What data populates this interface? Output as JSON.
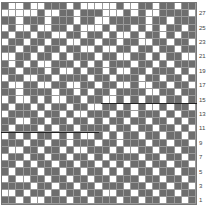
{
  "chart": {
    "type": "knitting-grid",
    "columns": 27,
    "rows": 28,
    "dark_color": "#6e6e6e",
    "light_color": "#ffffff",
    "row_labels": [
      "27",
      "25",
      "23",
      "21",
      "19",
      "17",
      "15",
      "13",
      "11",
      "9",
      "7",
      "5",
      "3",
      "1"
    ],
    "pattern_top_to_bottom": [
      "100100111010000010011011011",
      "000001001101110001010011110",
      "110111011101100111110110111",
      "010010011010001011010101101",
      "101101100110110100101101011",
      "011011011001101101100110110",
      "110110110110010011011011011",
      "001101101011101100110101100",
      "101010011101010111011010111",
      "110111010010110100110111010",
      "011001101111011011101101101",
      "100110011001101100100110110",
      "110111101101011011110011011",
      "010010100110110010101101101",
      "101101011011001101010010110",
      "011110110100111011011101011",
      "110011011011010110110110101",
      "101110101101111011011011010",
      "010101101010010101101101101",
      "111011011011101101110110110",
      "100110110100111010011011011",
      "011011011011010111101101101",
      "110101101101101010110110110",
      "101110110110110101011011011",
      "010011011011011011101101101",
      "111101101101101110110110110",
      "001011010110110011011011011",
      "110100111011011101101101101"
    ]
  }
}
